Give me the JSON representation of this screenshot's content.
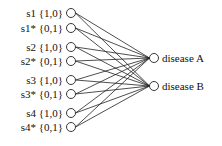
{
  "diagram": {
    "type": "bipartite-network",
    "inputs": [
      {
        "id": "s1",
        "label": "s1 {1,0}",
        "y": 13
      },
      {
        "id": "s1*",
        "label": "s1* {0,1}",
        "y": 28
      },
      {
        "id": "s2",
        "label": "s2 {1,0}",
        "y": 47
      },
      {
        "id": "s2*",
        "label": "s2* {0,1}",
        "y": 61
      },
      {
        "id": "s3",
        "label": "s3 {1,0}",
        "y": 80
      },
      {
        "id": "s3*",
        "label": "s3* {0,1}",
        "y": 94
      },
      {
        "id": "s4",
        "label": "s4 {1,0}",
        "y": 113
      },
      {
        "id": "s4*",
        "label": "s4* {0,1}",
        "y": 127
      }
    ],
    "outputs": [
      {
        "id": "A",
        "label": "disease A",
        "y": 58
      },
      {
        "id": "B",
        "label": "disease B",
        "y": 86
      }
    ],
    "edges": "all inputs fully connected to both outputs"
  }
}
